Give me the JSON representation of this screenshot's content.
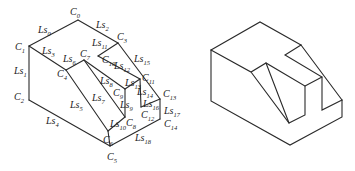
{
  "figures": [
    {
      "id": "labeled",
      "description": "Isometric solid with labeled vertices C0–C14 and edges Ls0–Ls18",
      "vertices": {
        "C0": [
          78,
          20
        ],
        "C1": [
          29,
          46
        ],
        "C2": [
          29,
          100
        ],
        "C3": [
          118,
          43
        ],
        "C4": [
          66,
          70
        ],
        "C5": [
          110,
          146
        ],
        "C6": [
          108,
          131
        ],
        "C7": [
          84,
          60
        ],
        "C8": [
          125,
          117
        ],
        "C9": [
          125,
          89
        ],
        "C10": [
          98,
          56
        ],
        "C11": [
          140,
          79
        ],
        "C12": [
          141,
          107
        ],
        "C13": [
          160,
          99
        ],
        "C14": [
          160,
          119
        ]
      },
      "edges": [
        {
          "label": "Ls0",
          "from": "C1",
          "to": "C0"
        },
        {
          "label": "Ls1",
          "from": "C1",
          "to": "C2"
        },
        {
          "label": "Ls2",
          "from": "C0",
          "to": "C3"
        },
        {
          "label": "Ls3",
          "from": "C1",
          "to": "C4"
        },
        {
          "label": "Ls4",
          "from": "C2",
          "to": "C5"
        },
        {
          "label": "Ls5",
          "from": "C4",
          "to": "C6"
        },
        {
          "label": "Ls6",
          "from": "C4",
          "to": "C7"
        },
        {
          "label": "Ls7",
          "from": "C7",
          "to": "C8"
        },
        {
          "label": "Ls8",
          "from": "C7",
          "to": "C9"
        },
        {
          "label": "Ls9",
          "from": "C9",
          "to": "C8"
        },
        {
          "label": "Ls10",
          "from": "C6",
          "to": "C8"
        },
        {
          "label": "Ls11",
          "from": "C10",
          "to": "C3"
        },
        {
          "label": "Ls12",
          "from": "C10",
          "to": "C11"
        },
        {
          "label": "Ls13",
          "from": "C9",
          "to": "C11"
        },
        {
          "label": "Ls14",
          "from": "C11",
          "to": "C12"
        },
        {
          "label": "Ls15",
          "from": "C3",
          "to": "C13"
        },
        {
          "label": "Ls16",
          "from": "C12",
          "to": "C13"
        },
        {
          "label": "Ls17",
          "from": "C13",
          "to": "C14"
        },
        {
          "label": "Ls18",
          "from": "C5",
          "to": "C14"
        }
      ],
      "extra_edges": [
        [
          "C6",
          "C5"
        ]
      ],
      "vertex_labels": [
        {
          "name": "C",
          "sub": "0",
          "x": 70,
          "y": 15
        },
        {
          "name": "C",
          "sub": "1",
          "x": 15,
          "y": 50
        },
        {
          "name": "C",
          "sub": "2",
          "x": 14,
          "y": 100
        },
        {
          "name": "C",
          "sub": "3",
          "x": 117,
          "y": 40
        },
        {
          "name": "C",
          "sub": "4",
          "x": 57,
          "y": 77
        },
        {
          "name": "C",
          "sub": "5",
          "x": 107,
          "y": 160
        },
        {
          "name": "C",
          "sub": "6",
          "x": 103,
          "y": 143
        },
        {
          "name": "C",
          "sub": "7",
          "x": 80,
          "y": 57
        },
        {
          "name": "C",
          "sub": "8",
          "x": 126,
          "y": 126
        },
        {
          "name": "C",
          "sub": "9",
          "x": 113,
          "y": 96
        },
        {
          "name": "C",
          "sub": "10",
          "x": 102,
          "y": 63
        },
        {
          "name": "C",
          "sub": "11",
          "x": 142,
          "y": 81
        },
        {
          "name": "C",
          "sub": "12",
          "x": 141,
          "y": 118
        },
        {
          "name": "C",
          "sub": "13",
          "x": 163,
          "y": 97
        },
        {
          "name": "C",
          "sub": "14",
          "x": 164,
          "y": 127
        }
      ],
      "edge_labels": [
        {
          "name": "Ls",
          "sub": "0",
          "x": 38,
          "y": 33
        },
        {
          "name": "Ls",
          "sub": "1",
          "x": 14,
          "y": 74
        },
        {
          "name": "Ls",
          "sub": "2",
          "x": 96,
          "y": 28
        },
        {
          "name": "Ls",
          "sub": "3",
          "x": 42,
          "y": 54
        },
        {
          "name": "Ls",
          "sub": "4",
          "x": 46,
          "y": 124
        },
        {
          "name": "Ls",
          "sub": "5",
          "x": 70,
          "y": 108
        },
        {
          "name": "Ls",
          "sub": "6",
          "x": 63,
          "y": 62
        },
        {
          "name": "Ls",
          "sub": "7",
          "x": 92,
          "y": 101
        },
        {
          "name": "Ls",
          "sub": "8",
          "x": 100,
          "y": 84
        },
        {
          "name": "Ls",
          "sub": "9",
          "x": 120,
          "y": 108
        },
        {
          "name": "Ls",
          "sub": "10",
          "x": 110,
          "y": 127
        },
        {
          "name": "Ls",
          "sub": "11",
          "x": 92,
          "y": 46
        },
        {
          "name": "Ls",
          "sub": "12",
          "x": 114,
          "y": 69
        },
        {
          "name": "Ls",
          "sub": "13",
          "x": 125,
          "y": 86
        },
        {
          "name": "Ls",
          "sub": "14",
          "x": 137,
          "y": 95
        },
        {
          "name": "Ls",
          "sub": "15",
          "x": 134,
          "y": 62
        },
        {
          "name": "Ls",
          "sub": "16",
          "x": 143,
          "y": 107
        },
        {
          "name": "Ls",
          "sub": "17",
          "x": 164,
          "y": 114
        },
        {
          "name": "Ls",
          "sub": "18",
          "x": 135,
          "y": 141
        }
      ]
    },
    {
      "id": "unlabeled",
      "description": "Same isometric solid rendered without labels",
      "polylines": [
        [
          [
            211,
            50
          ],
          [
            260,
            22
          ],
          [
            301,
            45
          ]
        ],
        [
          [
            211,
            50
          ],
          [
            211,
            101
          ],
          [
            290,
            145
          ],
          [
            342,
            117
          ],
          [
            342,
            100
          ]
        ],
        [
          [
            211,
            50
          ],
          [
            251,
            72
          ],
          [
            266,
            63
          ],
          [
            305,
            86
          ],
          [
            305,
            115
          ],
          [
            289,
            123
          ],
          [
            251,
            72
          ]
        ],
        [
          [
            266,
            63
          ],
          [
            289,
            123
          ]
        ],
        [
          [
            301,
            45
          ],
          [
            342,
            100
          ]
        ],
        [
          [
            301,
            45
          ],
          [
            285,
            55
          ],
          [
            322,
            77
          ],
          [
            322,
            110
          ],
          [
            342,
            100
          ]
        ],
        [
          [
            305,
            86
          ],
          [
            322,
            77
          ]
        ]
      ]
    }
  ]
}
